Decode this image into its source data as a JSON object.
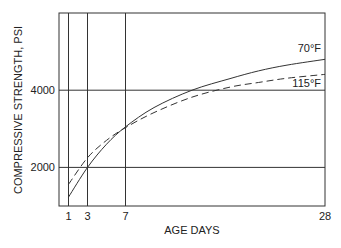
{
  "chart_data": {
    "type": "line",
    "title": "",
    "xlabel": "AGE DAYS",
    "ylabel": "COMPRESSIVE STRENGTH, PSI",
    "xlim": [
      0,
      28
    ],
    "ylim": [
      1000,
      6000
    ],
    "x_ticks": [
      1,
      3,
      7,
      28
    ],
    "x_tick_labels": [
      "1",
      "3",
      "7",
      "28"
    ],
    "y_ticks": [
      2000,
      4000
    ],
    "y_tick_labels": [
      "2000",
      "4000"
    ],
    "grid": {
      "vertical_at": [
        1,
        3,
        7
      ],
      "horizontal_at": [
        2000,
        4000
      ]
    },
    "legend": "inline labels at right end of curves",
    "series": [
      {
        "name": "70°F",
        "style": "solid",
        "x": [
          1,
          3,
          5,
          7,
          10,
          14,
          18,
          21,
          24,
          28
        ],
        "values": [
          1230,
          2000,
          2600,
          3050,
          3550,
          4000,
          4300,
          4500,
          4650,
          4800
        ]
      },
      {
        "name": "115°F",
        "style": "dashed",
        "x": [
          1,
          3,
          5,
          7,
          10,
          14,
          18,
          21,
          24,
          28
        ],
        "values": [
          1560,
          2250,
          2700,
          3030,
          3420,
          3820,
          4080,
          4200,
          4310,
          4410
        ]
      }
    ]
  }
}
